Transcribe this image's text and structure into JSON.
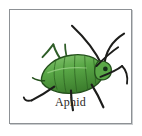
{
  "card": {
    "label": "Aphid",
    "border_color": "#8d9195",
    "background_color": "#ffffff",
    "label_color": "#2a2724"
  },
  "illustration": {
    "subject": "aphid",
    "body_color": "#5aa847",
    "body_shade_color": "#3d7f2e",
    "body_outline_color": "#24501c",
    "body_highlight_color": "#8cc877",
    "limb_color": "#1d1d1b",
    "leg_color": "#2f5d28",
    "eye_color": "#16301a",
    "antenna_count": 2,
    "leg_count": 6
  }
}
